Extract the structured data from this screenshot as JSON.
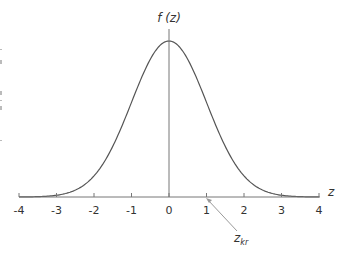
{
  "chart_data": {
    "type": "line",
    "title": "",
    "xlabel": "z",
    "ylabel": "f (z)",
    "xlim": [
      -4,
      4
    ],
    "ylim": [
      0,
      0.4
    ],
    "grid": false,
    "legend": null,
    "x_ticks": [
      "-4",
      "-3",
      "-2",
      "-1",
      "0",
      "1",
      "2",
      "3",
      "4"
    ],
    "series": [
      {
        "name": "standard normal density f(z)",
        "x": [
          -4,
          -3.5,
          -3,
          -2.5,
          -2,
          -1.5,
          -1,
          -0.5,
          0,
          0.5,
          1,
          1.5,
          2,
          2.5,
          3,
          3.5,
          4
        ],
        "values": [
          0.0001,
          0.0009,
          0.0044,
          0.0175,
          0.054,
          0.1295,
          0.242,
          0.3521,
          0.3989,
          0.3521,
          0.242,
          0.1295,
          0.054,
          0.0175,
          0.0044,
          0.0009,
          0.0001
        ]
      }
    ],
    "annotations": [
      {
        "text": "z_kr",
        "main": "z",
        "sub": "kr",
        "points_to_x": 1
      }
    ],
    "colors": {
      "curve": "#555555",
      "axis": "#777777",
      "arrow": "#9a9a9a"
    }
  }
}
